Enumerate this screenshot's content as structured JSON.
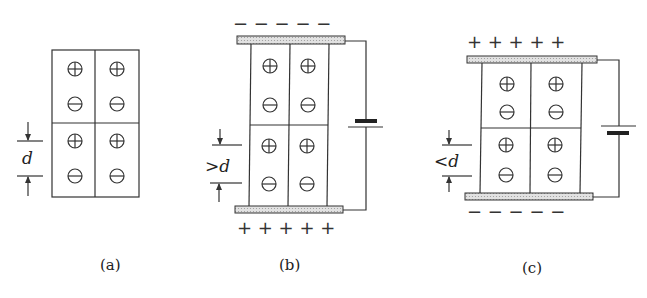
{
  "figure": {
    "panels": [
      {
        "id": "a",
        "caption": "(a)",
        "spacing_label": "d",
        "plates": false
      },
      {
        "id": "b",
        "caption": "(b)",
        "spacing_label": ">d",
        "top_plate_charge": "− − − − −",
        "bottom_plate_charge": "+ + + + +"
      },
      {
        "id": "c",
        "caption": "(c)",
        "spacing_label": "<d",
        "top_plate_charge": "+ + + + +",
        "bottom_plate_charge": "− − − − −"
      }
    ],
    "cell_symbols": {
      "positive": "⊕",
      "negative": "⊖"
    }
  }
}
